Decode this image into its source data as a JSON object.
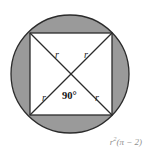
{
  "figure": {
    "type": "geometry-diagram",
    "background_color": "#ffffff",
    "shaded_region_color": "#9a9a9a",
    "inner_region_color": "#ffffff",
    "stroke_color": "#2b2b2b",
    "circle": {
      "center_x": 70,
      "center_y": 74,
      "radius": 59
    },
    "square": {
      "left": 30,
      "top": 33,
      "size": 82
    },
    "labels": {
      "radius_top_left": "r",
      "radius_top_right": "r",
      "radius_bottom_left": "r",
      "radius_bottom_right": "r",
      "central_angle": "90°"
    },
    "caption": {
      "base": "r",
      "exponent": "2",
      "expression": "(π − 2)",
      "full": "r²(π − 2)",
      "color": "#8f8f8f"
    }
  }
}
